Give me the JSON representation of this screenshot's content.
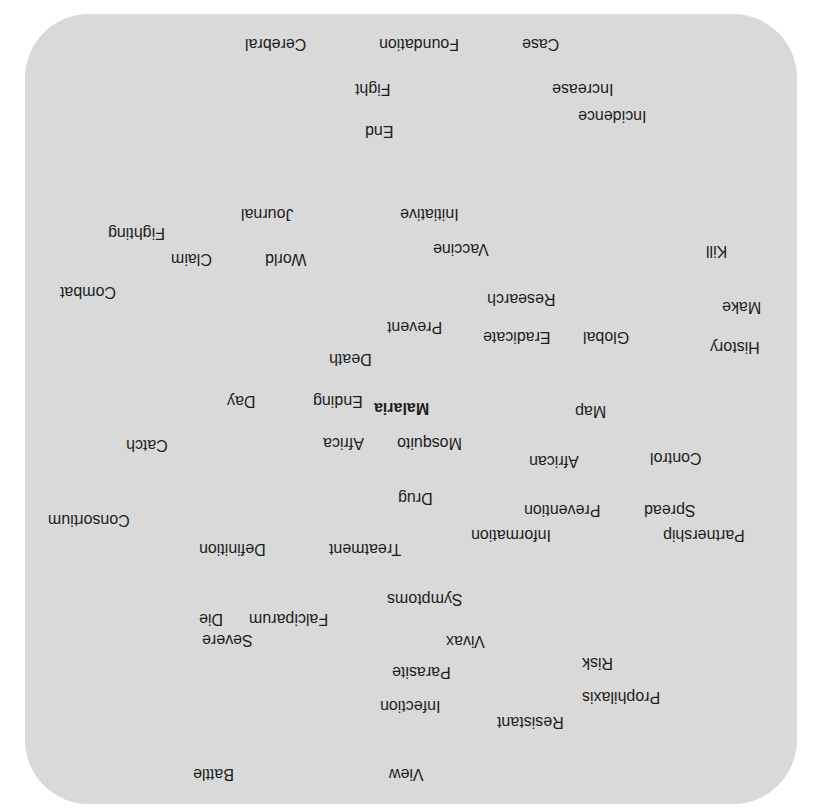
{
  "cloud": {
    "orientation": "rotated-180",
    "background_color": "#d9d9d9",
    "text_color": "#1e1e1e",
    "focus_word": "Malaria",
    "words": [
      {
        "text": "Cerebral",
        "x": 245,
        "y": 35
      },
      {
        "text": "Foundation",
        "x": 379,
        "y": 35
      },
      {
        "text": "Case",
        "x": 522,
        "y": 35
      },
      {
        "text": "Fight",
        "x": 355,
        "y": 80
      },
      {
        "text": "Increase",
        "x": 552,
        "y": 80
      },
      {
        "text": "Incidence",
        "x": 578,
        "y": 107
      },
      {
        "text": "End",
        "x": 365,
        "y": 122
      },
      {
        "text": "Journal",
        "x": 241,
        "y": 205
      },
      {
        "text": "Initiative",
        "x": 400,
        "y": 205
      },
      {
        "text": "Fighting",
        "x": 108,
        "y": 224
      },
      {
        "text": "Vaccine",
        "x": 433,
        "y": 240
      },
      {
        "text": "Kill",
        "x": 706,
        "y": 242
      },
      {
        "text": "World",
        "x": 265,
        "y": 250
      },
      {
        "text": "Claim",
        "x": 171,
        "y": 250
      },
      {
        "text": "Combat",
        "x": 60,
        "y": 283
      },
      {
        "text": "Research",
        "x": 487,
        "y": 290
      },
      {
        "text": "Make",
        "x": 722,
        "y": 298
      },
      {
        "text": "Prevent",
        "x": 387,
        "y": 318
      },
      {
        "text": "Eradicate",
        "x": 483,
        "y": 328
      },
      {
        "text": "Global",
        "x": 583,
        "y": 328
      },
      {
        "text": "History",
        "x": 710,
        "y": 338
      },
      {
        "text": "Death",
        "x": 329,
        "y": 350
      },
      {
        "text": "Ending",
        "x": 313,
        "y": 392
      },
      {
        "text": "Day",
        "x": 227,
        "y": 392
      },
      {
        "text": "Malaria",
        "x": 374,
        "y": 399,
        "bold": true
      },
      {
        "text": "Map",
        "x": 575,
        "y": 402
      },
      {
        "text": "Mosquito",
        "x": 397,
        "y": 434
      },
      {
        "text": "Africa",
        "x": 323,
        "y": 434
      },
      {
        "text": "Catch",
        "x": 126,
        "y": 436
      },
      {
        "text": "Control",
        "x": 650,
        "y": 449
      },
      {
        "text": "African",
        "x": 529,
        "y": 452
      },
      {
        "text": "Drug",
        "x": 398,
        "y": 489
      },
      {
        "text": "Spread",
        "x": 644,
        "y": 501
      },
      {
        "text": "Prevention",
        "x": 524,
        "y": 501
      },
      {
        "text": "Consortium",
        "x": 48,
        "y": 511
      },
      {
        "text": "Partnership",
        "x": 663,
        "y": 526
      },
      {
        "text": "Information",
        "x": 471,
        "y": 526
      },
      {
        "text": "Treatment",
        "x": 329,
        "y": 540
      },
      {
        "text": "Definition",
        "x": 199,
        "y": 540
      },
      {
        "text": "Symptoms",
        "x": 387,
        "y": 590
      },
      {
        "text": "Falciparum",
        "x": 249,
        "y": 610
      },
      {
        "text": "Die",
        "x": 199,
        "y": 610
      },
      {
        "text": "Severe",
        "x": 202,
        "y": 631
      },
      {
        "text": "Vivax",
        "x": 446,
        "y": 632
      },
      {
        "text": "Risk",
        "x": 582,
        "y": 654
      },
      {
        "text": "Parasite",
        "x": 392,
        "y": 663
      },
      {
        "text": "Prophilaxis",
        "x": 582,
        "y": 688
      },
      {
        "text": "Infection",
        "x": 380,
        "y": 697
      },
      {
        "text": "Resistant",
        "x": 497,
        "y": 713
      },
      {
        "text": "View",
        "x": 389,
        "y": 765
      },
      {
        "text": "Battle",
        "x": 193,
        "y": 765
      }
    ]
  }
}
